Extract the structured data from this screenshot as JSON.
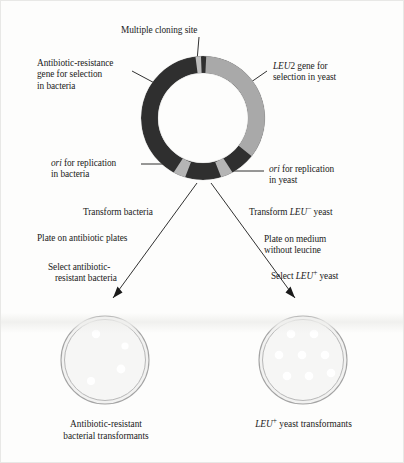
{
  "figure": {
    "background_color": "#fdfdfc"
  },
  "colors": {
    "segment_dark": "#2f2f2f",
    "segment_light": "#a9a9a9",
    "segment_marker": "#b9b9b9",
    "leader_line": "#1a1a1a",
    "dish_rim": "#9b9b9b",
    "dish_fill": "#f1f1f0",
    "colony": "#ffffff",
    "text": "#1a1a1a"
  },
  "plasmid": {
    "name": "shuttle-vector-plasmid",
    "center_x": 202,
    "center_y": 117,
    "outer_radius": 62,
    "inner_radius": 45,
    "segments": [
      {
        "name": "multiple-cloning-site",
        "label": "Multiple cloning site",
        "start_deg": -97,
        "end_deg": -87,
        "fill": "light"
      },
      {
        "name": "leu2-gene",
        "label": "LEU2 gene for selection in yeast",
        "start_deg": -87,
        "end_deg": 38,
        "fill": "light"
      },
      {
        "name": "yeast-ori-right",
        "label": "ori for replication in yeast",
        "start_deg": 62,
        "end_deg": 73,
        "fill": "light"
      },
      {
        "name": "bacteria-ori-left",
        "label": "ori for replication in bacteria",
        "start_deg": 107,
        "end_deg": 118,
        "fill": "light"
      },
      {
        "name": "antibiotic-resistance-gene",
        "label": "Antibiotic-resistance gene for selection in bacteria",
        "start_deg": 118,
        "end_deg": 263,
        "fill": "dark"
      }
    ]
  },
  "labels": {
    "multiple_cloning_site": "Multiple cloning site",
    "antibiotic_resistance": {
      "line1": "Antibiotic-resistance",
      "line2": "gene for selection",
      "line3": "in bacteria"
    },
    "leu2_gene": {
      "italic": "LEU",
      "plain_after": "2 gene for",
      "line2": "selection in yeast"
    },
    "ori_bacteria": {
      "italic": "ori",
      "rest": " for replication",
      "line2": "in bacteria"
    },
    "ori_yeast": {
      "italic": "ori",
      "rest": " for replication",
      "line2": "in yeast"
    }
  },
  "branches": {
    "bacteria": {
      "name": "bacteria-branch",
      "steps": [
        {
          "name": "transform-bacteria-step",
          "text": "Transform bacteria"
        },
        {
          "name": "plate-antibiotic-step",
          "text": "Plate on antibiotic plates"
        },
        {
          "name": "select-resistant-step-line1",
          "text": "Select antibiotic-"
        },
        {
          "name": "select-resistant-step-line2",
          "text": "resistant bacteria"
        }
      ],
      "dish": {
        "name": "bacterial-transformant-dish",
        "center_x": 104,
        "center_y": 359,
        "radius": 44,
        "colony_count": 4,
        "colonies": [
          {
            "cx": 95,
            "cy": 333,
            "r": 4.2
          },
          {
            "cx": 124,
            "cy": 345,
            "r": 3.6
          },
          {
            "cx": 120,
            "cy": 368,
            "r": 4.4
          },
          {
            "cx": 90,
            "cy": 380,
            "r": 4.0
          }
        ]
      },
      "caption": {
        "line1": "Antibiotic-resistant",
        "line2": "bacterial transformants"
      }
    },
    "yeast": {
      "name": "yeast-branch",
      "steps": [
        {
          "name": "transform-leu-minus-yeast-step",
          "prefix": "Transform ",
          "italic": "LEU",
          "sup": "−",
          "suffix": " yeast"
        },
        {
          "name": "plate-medium-step-line1",
          "text": "Plate on medium"
        },
        {
          "name": "plate-medium-step-line2",
          "text": "without leucine"
        },
        {
          "name": "select-leu-plus-step",
          "prefix": "Select ",
          "italic": "LEU",
          "sup": "+",
          "suffix": " yeast"
        }
      ],
      "dish": {
        "name": "yeast-transformant-dish",
        "center_x": 302,
        "center_y": 359,
        "radius": 44,
        "colony_count": 8,
        "colonies": [
          {
            "cx": 290,
            "cy": 333,
            "r": 4.3
          },
          {
            "cx": 313,
            "cy": 333,
            "r": 4.3
          },
          {
            "cx": 278,
            "cy": 354,
            "r": 4.3
          },
          {
            "cx": 301,
            "cy": 354,
            "r": 4.3
          },
          {
            "cx": 324,
            "cy": 354,
            "r": 4.3
          },
          {
            "cx": 286,
            "cy": 375,
            "r": 4.3
          },
          {
            "cx": 308,
            "cy": 375,
            "r": 4.3
          },
          {
            "cx": 330,
            "cy": 372,
            "r": 4.3
          }
        ]
      },
      "caption": {
        "italic": "LEU",
        "sup": "+",
        "rest": " yeast transformants"
      }
    }
  }
}
